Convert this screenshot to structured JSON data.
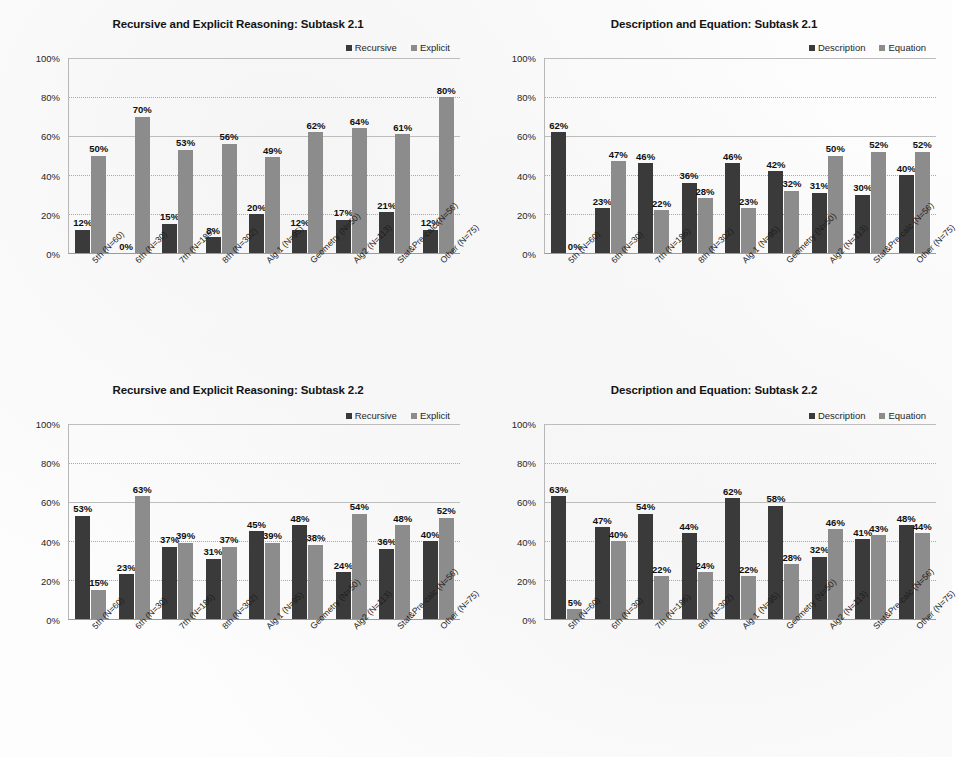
{
  "figure": {
    "background": "#fdfdfd",
    "series_colors": {
      "dark": "#3a3a3a",
      "light": "#8c8c8c"
    }
  },
  "categories": [
    "5th (N=60)",
    "6th (N=30)",
    "7th (N=186)",
    "8th (N=302)",
    "Alg 1 (N=95)",
    "Geometry (N=50)",
    "Alg2 (N=113)",
    "Stat&Pre-calc (N=56)",
    "Other (N=75)"
  ],
  "y_ticks": [
    "0%",
    "20%",
    "40%",
    "60%",
    "80%",
    "100%"
  ],
  "chart_data": [
    {
      "id": "chart-recursive-explicit-2-1",
      "type": "bar",
      "title": "Recursive and Explicit Reasoning: Subtask 2.1",
      "xlabel": "",
      "ylabel": "",
      "ylim": [
        0,
        100
      ],
      "grid": true,
      "legend_position": "top-right",
      "categories": [
        "5th (N=60)",
        "6th (N=30)",
        "7th (N=186)",
        "8th (N=302)",
        "Alg 1 (N=95)",
        "Geometry (N=50)",
        "Alg2 (N=113)",
        "Stat&Pre-calc (N=56)",
        "Other (N=75)"
      ],
      "series": [
        {
          "name": "Recursive",
          "color": "#3a3a3a",
          "values": [
            12,
            0,
            15,
            8,
            20,
            12,
            17,
            21,
            12
          ],
          "labels": [
            "12%",
            "0%",
            "15%",
            "8%",
            "20%",
            "12%",
            "17%",
            "21%",
            "12%"
          ]
        },
        {
          "name": "Explicit",
          "color": "#8c8c8c",
          "values": [
            50,
            70,
            53,
            56,
            49,
            62,
            64,
            61,
            80
          ],
          "labels": [
            "50%",
            "70%",
            "53%",
            "56%",
            "49%",
            "62%",
            "64%",
            "61%",
            "80%"
          ]
        }
      ]
    },
    {
      "id": "chart-description-equation-2-1",
      "type": "bar",
      "title": "Description and Equation: Subtask 2.1",
      "xlabel": "",
      "ylabel": "",
      "ylim": [
        0,
        100
      ],
      "grid": true,
      "legend_position": "top-right",
      "categories": [
        "5th (N=60)",
        "6th (N=30)",
        "7th (N=186)",
        "8th (N=302)",
        "Alg 1 (N=95)",
        "Geometry (N=50)",
        "Alg2 (N=113)",
        "Stat&Pre-calc (N=56)",
        "Other (N=75)"
      ],
      "series": [
        {
          "name": "Description",
          "color": "#3a3a3a",
          "values": [
            62,
            23,
            46,
            36,
            46,
            42,
            31,
            30,
            40
          ],
          "labels": [
            "62%",
            "23%",
            "46%",
            "36%",
            "46%",
            "42%",
            "31%",
            "30%",
            "40%"
          ]
        },
        {
          "name": "Equation",
          "color": "#8c8c8c",
          "values": [
            0,
            47,
            22,
            28,
            23,
            32,
            50,
            52,
            52
          ],
          "labels": [
            "0%",
            "47%",
            "22%",
            "28%",
            "23%",
            "32%",
            "50%",
            "52%",
            "52%"
          ]
        }
      ]
    },
    {
      "id": "chart-recursive-explicit-2-2",
      "type": "bar",
      "title": "Recursive and Explicit Reasoning: Subtask 2.2",
      "xlabel": "",
      "ylabel": "",
      "ylim": [
        0,
        100
      ],
      "grid": true,
      "legend_position": "top-right",
      "categories": [
        "5th (N=60)",
        "6th (N=30)",
        "7th (N=186)",
        "8th (N=302)",
        "Alg 1 (N=95)",
        "Geometry (N=50)",
        "Alg2 (N=113)",
        "Stat&Pre-calc (N=56)",
        "Other (N=75)"
      ],
      "series": [
        {
          "name": "Recursive",
          "color": "#3a3a3a",
          "values": [
            53,
            23,
            37,
            31,
            45,
            48,
            24,
            36,
            40
          ],
          "labels": [
            "53%",
            "23%",
            "37%",
            "31%",
            "45%",
            "48%",
            "24%",
            "36%",
            "40%"
          ]
        },
        {
          "name": "Explicit",
          "color": "#8c8c8c",
          "values": [
            15,
            63,
            39,
            37,
            39,
            38,
            54,
            48,
            52
          ],
          "labels": [
            "15%",
            "63%",
            "39%",
            "37%",
            "39%",
            "38%",
            "54%",
            "48%",
            "52%"
          ]
        }
      ]
    },
    {
      "id": "chart-description-equation-2-2",
      "type": "bar",
      "title": "Description and Equation: Subtask 2.2",
      "xlabel": "",
      "ylabel": "",
      "ylim": [
        0,
        100
      ],
      "grid": true,
      "legend_position": "top-right",
      "categories": [
        "5th (N=60)",
        "6th (N=30)",
        "7th (N=186)",
        "8th (N=302)",
        "Alg 1 (N=95)",
        "Geometry (N=50)",
        "Alg2 (N=113)",
        "Stat&Pre-calc (N=56)",
        "Other (N=75)"
      ],
      "series": [
        {
          "name": "Description",
          "color": "#3a3a3a",
          "values": [
            63,
            47,
            54,
            44,
            62,
            58,
            32,
            41,
            48
          ],
          "labels": [
            "63%",
            "47%",
            "54%",
            "44%",
            "62%",
            "58%",
            "32%",
            "41%",
            "48%"
          ]
        },
        {
          "name": "Equation",
          "color": "#8c8c8c",
          "values": [
            5,
            40,
            22,
            24,
            22,
            28,
            46,
            43,
            44
          ],
          "labels": [
            "5%",
            "40%",
            "22%",
            "24%",
            "22%",
            "28%",
            "46%",
            "43%",
            "44%"
          ]
        }
      ]
    }
  ]
}
